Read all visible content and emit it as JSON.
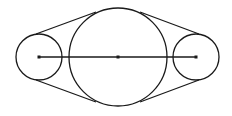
{
  "diagram": {
    "type": "belt-pulley",
    "stroke_color": "#1a1a1a",
    "background": "#ffffff",
    "circles": [
      {
        "name": "left-pulley",
        "cx": 39,
        "cy": 57,
        "r": 23
      },
      {
        "name": "center-pulley",
        "cx": 118,
        "cy": 57,
        "r": 49
      },
      {
        "name": "right-pulley",
        "cx": 196,
        "cy": 57,
        "r": 23
      }
    ],
    "center_line": {
      "x1": 39,
      "y1": 57,
      "x2": 196,
      "y2": 57
    },
    "center_points": [
      {
        "x": 39,
        "y": 57
      },
      {
        "x": 118,
        "y": 57
      },
      {
        "x": 196,
        "y": 57
      }
    ],
    "tangent_lines": [
      {
        "name": "top-left-belt",
        "x1": 36,
        "y1": 34,
        "x2": 96,
        "y2": 12
      },
      {
        "name": "top-right-belt",
        "x1": 140,
        "y1": 12,
        "x2": 199,
        "y2": 34
      },
      {
        "name": "bottom-left-belt",
        "x1": 36,
        "y1": 80,
        "x2": 96,
        "y2": 102
      },
      {
        "name": "bottom-right-belt",
        "x1": 140,
        "y1": 102,
        "x2": 199,
        "y2": 80
      }
    ]
  }
}
